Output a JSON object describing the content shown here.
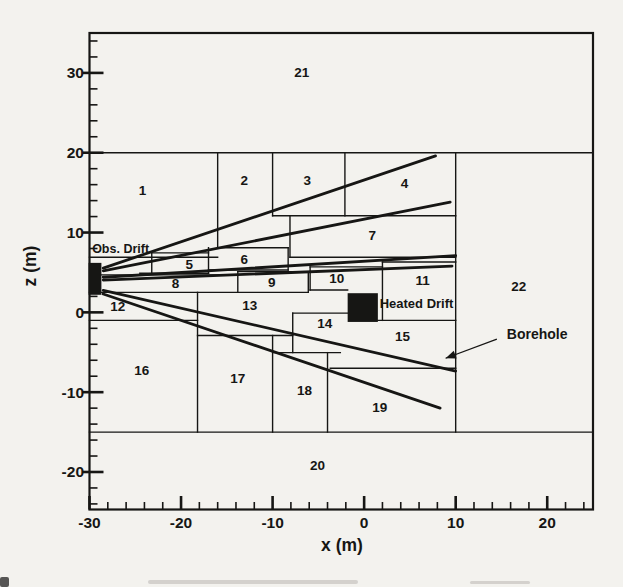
{
  "figure_title": "Numerical mesh cross-section with observation drift, heated drift and boreholes",
  "chart_data": {
    "type": "diagram-mesh",
    "xlabel": "x (m)",
    "ylabel": "z (m)",
    "x_range": [
      -30,
      25
    ],
    "z_range": [
      -24.7,
      35
    ],
    "x_major_ticks": [
      -30,
      -20,
      -10,
      0,
      10,
      20
    ],
    "z_major_ticks": [
      30,
      20,
      10,
      0,
      -10,
      -20
    ],
    "minor_tick_step": 2,
    "ink_color": "#161614",
    "paper_color": "#f3f2ee",
    "regions": [
      {
        "n": "1",
        "x": -24.2,
        "z": 15.3
      },
      {
        "n": "2",
        "x": -13.1,
        "z": 16.5
      },
      {
        "n": "3",
        "x": -6.2,
        "z": 16.5
      },
      {
        "n": "4",
        "x": 4.4,
        "z": 16.2
      },
      {
        "n": "5",
        "x": -19.1,
        "z": 6.0
      },
      {
        "n": "6",
        "x": -13.1,
        "z": 6.6
      },
      {
        "n": "7",
        "x": 0.9,
        "z": 9.6
      },
      {
        "n": "8",
        "x": -20.6,
        "z": 3.6
      },
      {
        "n": "9",
        "x": -10.1,
        "z": 3.7
      },
      {
        "n": "10",
        "x": -3.0,
        "z": 4.2
      },
      {
        "n": "11",
        "x": 6.4,
        "z": 4.0
      },
      {
        "n": "12",
        "x": -26.9,
        "z": 0.7
      },
      {
        "n": "13",
        "x": -12.5,
        "z": 0.8
      },
      {
        "n": "14",
        "x": -4.3,
        "z": -1.4
      },
      {
        "n": "15",
        "x": 4.2,
        "z": -3.0
      },
      {
        "n": "16",
        "x": -24.3,
        "z": -7.3
      },
      {
        "n": "17",
        "x": -13.8,
        "z": -8.3
      },
      {
        "n": "18",
        "x": -6.5,
        "z": -9.8
      },
      {
        "n": "19",
        "x": 1.7,
        "z": -11.9
      },
      {
        "n": "20",
        "x": -5.1,
        "z": -19.2
      },
      {
        "n": "21",
        "x": -6.8,
        "z": 30.0
      },
      {
        "n": "22",
        "x": 16.9,
        "z": 3.2
      }
    ],
    "mesh_segments": [
      [
        -30,
        20,
        25,
        20
      ],
      [
        -30,
        -15,
        25,
        -15
      ],
      [
        -30,
        6.9,
        -16,
        6.9
      ],
      [
        -16,
        8.1,
        -8.3,
        8.1
      ],
      [
        -10,
        12.1,
        10,
        12.1
      ],
      [
        -8.1,
        6.9,
        10,
        6.9
      ],
      [
        -23.2,
        7.45,
        -17,
        7.45
      ],
      [
        -24.5,
        4.9,
        -17,
        4.9
      ],
      [
        -17,
        5.3,
        -8.3,
        5.3
      ],
      [
        -13.8,
        5.1,
        -6.1,
        5.1
      ],
      [
        -29,
        4.7,
        -13.8,
        4.7
      ],
      [
        -30,
        2.5,
        -6.1,
        2.5
      ],
      [
        -5.9,
        5.7,
        2,
        5.7
      ],
      [
        2,
        6.3,
        10,
        6.3
      ],
      [
        -30,
        -1,
        -18.2,
        -1
      ],
      [
        -18.2,
        -2.9,
        -7.8,
        -2.9
      ],
      [
        -7.8,
        -0.1,
        -1.8,
        -0.1
      ],
      [
        -10,
        -5.05,
        -2.6,
        -5.05
      ],
      [
        1.5,
        -1,
        10,
        -1
      ],
      [
        -3.7,
        -7,
        10,
        -7
      ],
      [
        -5.9,
        2.8,
        -1.8,
        2.8
      ],
      [
        10,
        -15,
        10,
        20
      ],
      [
        -16,
        8.1,
        -16,
        20
      ],
      [
        -10,
        12.1,
        -10,
        20
      ],
      [
        -2.1,
        12.1,
        -2.1,
        20
      ],
      [
        -18.2,
        -15,
        -18.2,
        2.5
      ],
      [
        -10,
        -15,
        -10,
        -2.9
      ],
      [
        -4,
        -15,
        -4,
        -5.05
      ],
      [
        -7.8,
        -5.05,
        -7.8,
        -0.1
      ],
      [
        2,
        -1,
        2,
        6.3
      ],
      [
        -5.9,
        2.8,
        -5.9,
        5.7
      ],
      [
        -8.3,
        5.3,
        -8.3,
        8.1
      ],
      [
        -17,
        4.9,
        -17,
        8.1
      ],
      [
        -13.8,
        2.5,
        -13.8,
        5.1
      ],
      [
        -6.1,
        2.5,
        -6.1,
        5.1
      ],
      [
        -23.2,
        4.9,
        -23.2,
        7.45
      ],
      [
        -8.1,
        6.9,
        -8.1,
        12.1
      ]
    ],
    "boreholes": [
      [
        -28.5,
        5.55,
        7.8,
        19.6
      ],
      [
        -28.5,
        5.2,
        9.4,
        13.8
      ],
      [
        -28.5,
        4.4,
        10.0,
        7.1
      ],
      [
        -28.5,
        4.05,
        9.6,
        5.8
      ],
      [
        -28.5,
        2.75,
        10.0,
        -7.35
      ],
      [
        -28.5,
        2.3,
        8.3,
        -12.0
      ]
    ],
    "features": {
      "obs_drift": {
        "label": "Obs. Drift",
        "label_x": -26.6,
        "label_z": 7.9,
        "rect": {
          "x1": -30.1,
          "z1": 2.2,
          "x2": -28.7,
          "z2": 6.2
        }
      },
      "heated_drift": {
        "label": "Heated Drift",
        "label_x": 1.7,
        "label_z": 1.1,
        "rect": {
          "x1": -1.8,
          "z1": -1.2,
          "x2": 1.5,
          "z2": 2.4
        }
      },
      "borehole_annotation": {
        "label": "Borehole",
        "label_x": 18.9,
        "label_z": -2.85,
        "arrow_from": [
          14.5,
          -3.35
        ],
        "arrow_to": [
          8.9,
          -5.75
        ]
      }
    }
  }
}
